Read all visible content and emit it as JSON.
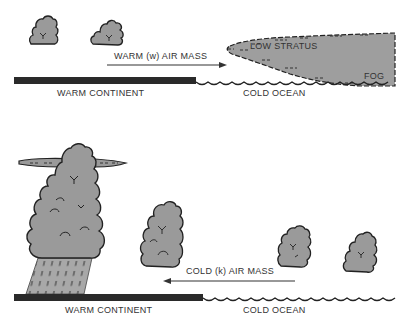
{
  "panels": [
    {
      "id": "top",
      "air_mass_label": "WARM (w) AIR MASS",
      "arrow_direction": "right",
      "cloud_labels": [
        "LOW STRATUS",
        "FOG"
      ],
      "land_label": "WARM CONTINENT",
      "sea_label": "COLD OCEAN"
    },
    {
      "id": "bottom",
      "air_mass_label": "COLD (k) AIR MASS",
      "arrow_direction": "left",
      "land_label": "WARM CONTINENT",
      "sea_label": "COLD OCEAN"
    }
  ],
  "colors": {
    "cloud_fill": "#9a9a9a",
    "outline": "#222222",
    "land": "#2a2a2a",
    "background": "#ffffff"
  }
}
